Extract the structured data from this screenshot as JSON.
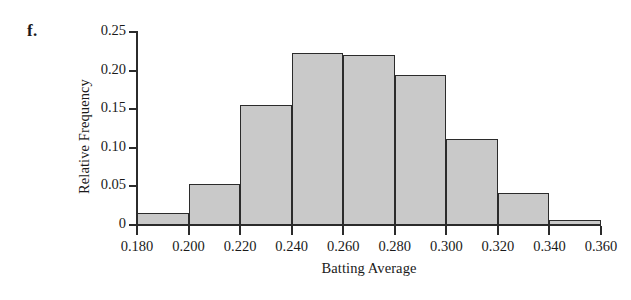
{
  "panel": {
    "label": "f."
  },
  "chart_data": {
    "type": "bar",
    "title": "",
    "subtitle": "",
    "xlabel": "Batting Average",
    "ylabel": "Relative Frequency",
    "bin_edges": [
      0.18,
      0.2,
      0.22,
      0.24,
      0.26,
      0.28,
      0.3,
      0.32,
      0.34,
      0.36
    ],
    "categories": [
      "0.180-0.200",
      "0.200-0.220",
      "0.220-0.240",
      "0.240-0.260",
      "0.260-0.280",
      "0.280-0.300",
      "0.300-0.320",
      "0.320-0.340",
      "0.340-0.360"
    ],
    "values": [
      0.015,
      0.053,
      0.155,
      0.223,
      0.22,
      0.194,
      0.111,
      0.041,
      0.006
    ],
    "xlim": [
      0.18,
      0.36
    ],
    "ylim": [
      0,
      0.25
    ],
    "x_tick_labels": [
      "0.180",
      "0.200",
      "0.220",
      "0.240",
      "0.260",
      "0.280",
      "0.300",
      "0.320",
      "0.340",
      "0.360"
    ],
    "x_tick_values": [
      0.18,
      0.2,
      0.22,
      0.24,
      0.26,
      0.28,
      0.3,
      0.32,
      0.34,
      0.36
    ],
    "y_tick_labels": [
      "0.25",
      "0.20",
      "0.15",
      "0.10",
      "0.05",
      "0"
    ],
    "y_tick_values": [
      0.25,
      0.2,
      0.15,
      0.1,
      0.05,
      0
    ],
    "grid": false,
    "legend": null,
    "bar_fill_color": "#c9c9c9",
    "bar_edge_color": "#2b2b2b",
    "axis_color": "#2b2b2b",
    "background_color": "#ffffff"
  }
}
